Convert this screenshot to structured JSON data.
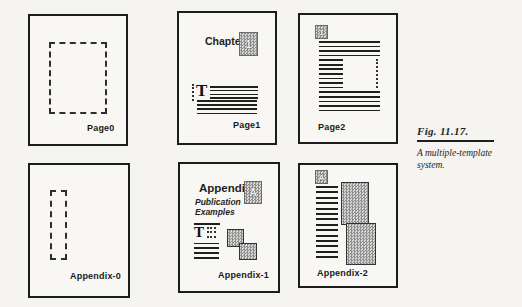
{
  "caption": {
    "title": "Fig. 11.17.",
    "line1": "A multiple-template",
    "line2": "system."
  },
  "panels": {
    "page0": {
      "label": "Page0"
    },
    "page1": {
      "label": "Page1",
      "heading": "Chapter",
      "badge": "1",
      "dropcap": "T"
    },
    "page2": {
      "label": "Page2",
      "badge": "1"
    },
    "appendix0": {
      "label": "Appendix-0"
    },
    "appendix1": {
      "label": "Appendix-1",
      "heading": "Appendix",
      "badge": "A",
      "subtitle1": "Publication",
      "subtitle2": "Examples",
      "dropcap": "T"
    },
    "appendix2": {
      "label": "Appendix-2",
      "badge": "A"
    }
  },
  "colors": {
    "ink": "#1f1f1f",
    "panel_border": "#1c1c1c",
    "hatch_dark": "#8f8f8f",
    "hatch_light": "#d8d8d8",
    "paper": "#f5f4f0"
  }
}
